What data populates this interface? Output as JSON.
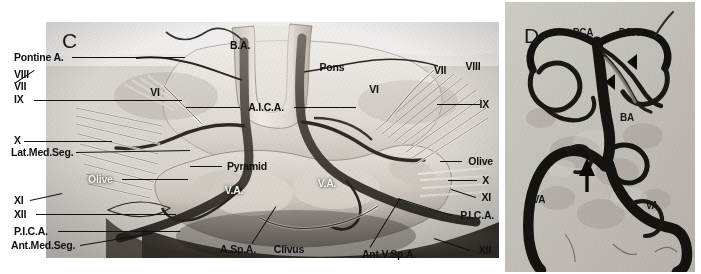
{
  "figure": {
    "background_color": "#ffffff",
    "width": 701,
    "height": 274
  },
  "panel_c": {
    "letter": "C",
    "letter_pos": {
      "x": 62,
      "y": 40
    },
    "frame": {
      "x": 46,
      "y": 22,
      "w": 453,
      "h": 236
    },
    "labels": [
      {
        "id": "pontine-a",
        "text": "Pontine A.",
        "x": 14,
        "y": 57,
        "align": "left",
        "style": "anat",
        "leader": {
          "x1": 72,
          "y1": 57,
          "x2": 185,
          "y2": 57
        }
      },
      {
        "id": "cn8-left",
        "text": "VIII",
        "x": 14,
        "y": 74,
        "align": "left",
        "style": "roman",
        "leader": null
      },
      {
        "id": "cn7-left",
        "text": "VII",
        "x": 14,
        "y": 86,
        "align": "left",
        "style": "roman",
        "leader": {
          "x1": 16,
          "y1": 82,
          "x2": 34,
          "y2": 70
        }
      },
      {
        "id": "cn9-left",
        "text": "IX",
        "x": 14,
        "y": 99,
        "align": "left",
        "style": "roman",
        "leader": {
          "x1": 34,
          "y1": 100,
          "x2": 182,
          "y2": 100
        }
      },
      {
        "id": "cn10-left",
        "text": "X",
        "x": 14,
        "y": 140,
        "align": "left",
        "style": "roman",
        "leader": {
          "x1": 24,
          "y1": 141,
          "x2": 112,
          "y2": 141
        }
      },
      {
        "id": "lat-med-seg",
        "text": "Lat.Med.Seg.",
        "x": 11,
        "y": 152,
        "align": "left",
        "style": "anat",
        "leader": {
          "x1": 76,
          "y1": 152,
          "x2": 190,
          "y2": 150
        }
      },
      {
        "id": "olive-left",
        "text": "Olive",
        "x": 88,
        "y": 179,
        "align": "left",
        "style": "anat-on",
        "leader": {
          "x1": 122,
          "y1": 179,
          "x2": 188,
          "y2": 179
        }
      },
      {
        "id": "cn11-left",
        "text": "XI",
        "x": 14,
        "y": 200,
        "align": "left",
        "style": "roman",
        "leader": {
          "x1": 30,
          "y1": 200,
          "x2": 62,
          "y2": 193
        }
      },
      {
        "id": "cn12-left",
        "text": "XII",
        "x": 14,
        "y": 214,
        "align": "left",
        "style": "roman",
        "leader": {
          "x1": 36,
          "y1": 214,
          "x2": 176,
          "y2": 214
        }
      },
      {
        "id": "pica-left",
        "text": "P.I.C.A.",
        "x": 14,
        "y": 231,
        "align": "left",
        "style": "anat",
        "leader": {
          "x1": 58,
          "y1": 231,
          "x2": 180,
          "y2": 231
        }
      },
      {
        "id": "ant-med-seg",
        "text": "Ant.Med.Seg.",
        "x": 11,
        "y": 245,
        "align": "left",
        "style": "anat",
        "leader": {
          "x1": 80,
          "y1": 245,
          "x2": 152,
          "y2": 233
        }
      },
      {
        "id": "cn6-left",
        "text": "VI",
        "x": 155,
        "y": 92,
        "align": "center",
        "style": "roman",
        "leader": null
      },
      {
        "id": "basilar-artery",
        "text": "B.A.",
        "x": 240,
        "y": 45,
        "align": "center",
        "style": "anat-dk",
        "leader": null
      },
      {
        "id": "pons",
        "text": "Pons",
        "x": 332,
        "y": 67,
        "align": "center",
        "style": "anat-dk",
        "leader": null
      },
      {
        "id": "aica",
        "text": "A.I.C.A.",
        "x": 266,
        "y": 107,
        "align": "center",
        "style": "anat",
        "leader": {
          "x1": 186,
          "y1": 107,
          "x2": 240,
          "y2": 107
        }
      },
      {
        "id": "aica-right-lead",
        "text": "",
        "x": 0,
        "y": 0,
        "align": "left",
        "style": "anat",
        "leader": {
          "x1": 294,
          "y1": 107,
          "x2": 356,
          "y2": 107
        }
      },
      {
        "id": "pyramid",
        "text": "Pyramid",
        "x": 247,
        "y": 166,
        "align": "center",
        "style": "anat-dk",
        "leader": {
          "x1": 190,
          "y1": 166,
          "x2": 222,
          "y2": 166
        }
      },
      {
        "id": "va-left",
        "text": "V.A.",
        "x": 234,
        "y": 190,
        "align": "center",
        "style": "anat-on",
        "leader": null
      },
      {
        "id": "va-right",
        "text": "V.A.",
        "x": 327,
        "y": 183,
        "align": "center",
        "style": "anat-on",
        "leader": null
      },
      {
        "id": "asp-a",
        "text": "A.Sp.A.",
        "x": 238,
        "y": 249,
        "align": "center",
        "style": "anat-dk",
        "leader": {
          "x1": 252,
          "y1": 243,
          "x2": 276,
          "y2": 206
        }
      },
      {
        "id": "clivus",
        "text": "Clivus",
        "x": 289,
        "y": 249,
        "align": "center",
        "style": "anat-dk",
        "leader": null
      },
      {
        "id": "ant-v-sp-a",
        "text": "Ant.V.Sp.A.",
        "x": 389,
        "y": 254,
        "align": "center",
        "style": "anat-dk",
        "leader": {
          "x1": 370,
          "y1": 247,
          "x2": 400,
          "y2": 198
        }
      },
      {
        "id": "cn6-right",
        "text": "VI",
        "x": 374,
        "y": 89,
        "align": "center",
        "style": "roman",
        "leader": null
      },
      {
        "id": "cn7-right",
        "text": "VII",
        "x": 440,
        "y": 70,
        "align": "center",
        "style": "roman",
        "leader": null
      },
      {
        "id": "cn8-right",
        "text": "VIII",
        "x": 473,
        "y": 66,
        "align": "center",
        "style": "roman",
        "leader": null
      },
      {
        "id": "cn9-right",
        "text": "IX",
        "x": 489,
        "y": 104,
        "align": "rightal",
        "style": "roman",
        "leader": {
          "x1": 437,
          "y1": 104,
          "x2": 480,
          "y2": 104
        }
      },
      {
        "id": "olive-right",
        "text": "Olive",
        "x": 493,
        "y": 161,
        "align": "rightal",
        "style": "anat",
        "leader": {
          "x1": 440,
          "y1": 161,
          "x2": 462,
          "y2": 161
        }
      },
      {
        "id": "cn10-right",
        "text": "X",
        "x": 489,
        "y": 180,
        "align": "rightal",
        "style": "roman",
        "leader": {
          "x1": 448,
          "y1": 180,
          "x2": 477,
          "y2": 180
        }
      },
      {
        "id": "cn11-right",
        "text": "XI",
        "x": 491,
        "y": 197,
        "align": "rightal",
        "style": "roman",
        "leader": {
          "x1": 451,
          "y1": 189,
          "x2": 476,
          "y2": 197
        }
      },
      {
        "id": "pica-right",
        "text": "P.I.C.A.",
        "x": 494,
        "y": 215,
        "align": "rightal",
        "style": "anat",
        "leader": {
          "x1": 398,
          "y1": 198,
          "x2": 452,
          "y2": 215
        }
      },
      {
        "id": "cn12-right",
        "text": "XII",
        "x": 491,
        "y": 250,
        "align": "rightal",
        "style": "roman",
        "leader": {
          "x1": 434,
          "y1": 238,
          "x2": 470,
          "y2": 250
        }
      }
    ]
  },
  "panel_d": {
    "letter": "D",
    "letter_pos": {
      "x": 524,
      "y": 35
    },
    "frame": {
      "x": 505,
      "y": 2,
      "w": 190,
      "h": 270
    },
    "labels": [
      {
        "id": "pca-left",
        "text": "PCA",
        "x": 583,
        "y": 33,
        "style": "dlbl"
      },
      {
        "id": "pca-right",
        "text": "PCA",
        "x": 629,
        "y": 33,
        "style": "dlbl"
      },
      {
        "id": "ba",
        "text": "BA",
        "x": 627,
        "y": 118,
        "style": "dlbl"
      },
      {
        "id": "va-left",
        "text": "VA",
        "x": 539,
        "y": 200,
        "style": "dlbl"
      },
      {
        "id": "va-right",
        "text": "VA",
        "x": 652,
        "y": 206,
        "style": "dlbl"
      }
    ],
    "markers": [
      {
        "id": "arrowhead-upper",
        "type": "arrowhead",
        "x": 630,
        "y": 78
      },
      {
        "id": "arrowhead-lower",
        "type": "arrowhead",
        "x": 609,
        "y": 98
      },
      {
        "id": "arrow-up",
        "type": "arrow-up",
        "x": 587,
        "y": 170
      }
    ]
  },
  "colors": {
    "vessel_dark": "#14120f",
    "label_text": "#111111",
    "panel_c_bg": "#e8e5e0",
    "panel_d_bg": "#c4c0ba",
    "page_bg": "#ffffff"
  }
}
